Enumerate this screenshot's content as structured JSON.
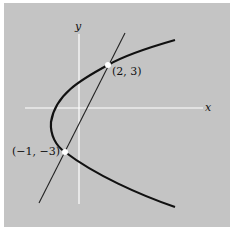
{
  "figure": {
    "axes": {
      "x_label": "x",
      "y_label": "y"
    },
    "points": [
      {
        "label": "(2, 3)",
        "x": 2,
        "y": 3
      },
      {
        "label": "(−1, −3)",
        "x": -1,
        "y": -3
      }
    ],
    "curves": [
      {
        "type": "parabola",
        "opens": "right",
        "description": "parabola intersecting line at two points"
      },
      {
        "type": "line",
        "description": "secant line through (2,3) and (-1,-3)"
      }
    ],
    "colors": {
      "background": "#c4c4c4",
      "axes": "#ffffff",
      "curve": "#111111",
      "points": "#ffffff"
    }
  }
}
